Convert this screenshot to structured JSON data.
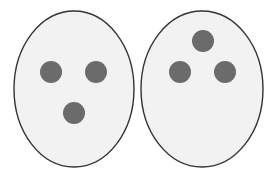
{
  "diagram": {
    "colors": {
      "background": "#ffffff",
      "oval_fill": "#f2f2f2",
      "oval_stroke": "#333333",
      "dot_fill": "#6b6b6b"
    },
    "ovals": [
      {
        "id": "left",
        "cx": 74,
        "cy": 89,
        "rx": 60,
        "ry": 78,
        "arrangement": "two dots on top, one dot below (downward triangle)",
        "dots": [
          {
            "cx": 51,
            "cy": 72,
            "r": 11
          },
          {
            "cx": 96,
            "cy": 72,
            "r": 11
          },
          {
            "cx": 74,
            "cy": 113,
            "r": 11
          }
        ]
      },
      {
        "id": "right",
        "cx": 202,
        "cy": 89,
        "rx": 61,
        "ry": 78,
        "arrangement": "one dot on top, two dots below (upward triangle)",
        "dots": [
          {
            "cx": 203,
            "cy": 41,
            "r": 11
          },
          {
            "cx": 180,
            "cy": 72,
            "r": 11
          },
          {
            "cx": 225,
            "cy": 72,
            "r": 11
          }
        ]
      }
    ]
  }
}
